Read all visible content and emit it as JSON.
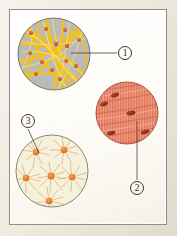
{
  "figure": {
    "background_color": "#f2ede2",
    "frame_color": "#8f8f8a",
    "frame_fill": "#fdfcf8",
    "caption": "",
    "panels": [
      {
        "id": "panel-1",
        "label": "1",
        "tissue": "loose connective tissue",
        "center_x": 54,
        "center_y": 54,
        "radius": 36,
        "background_color": "#b3b3b3",
        "fiber_color": "#f5c518",
        "fiber_highlight": "#ffe469",
        "nucleus_color": "#d4572a",
        "outline_color": "#6e6e6e",
        "nuclei": [
          {
            "x": 31,
            "y": 33
          },
          {
            "x": 46,
            "y": 29
          },
          {
            "x": 65,
            "y": 30
          },
          {
            "x": 56,
            "y": 44
          },
          {
            "x": 67,
            "y": 46
          },
          {
            "x": 79,
            "y": 40
          },
          {
            "x": 30,
            "y": 53
          },
          {
            "x": 42,
            "y": 62
          },
          {
            "x": 52,
            "y": 70
          },
          {
            "x": 66,
            "y": 61
          },
          {
            "x": 76,
            "y": 66
          },
          {
            "x": 36,
            "y": 74
          },
          {
            "x": 60,
            "y": 79
          }
        ]
      },
      {
        "id": "panel-2",
        "label": "2",
        "tissue": "smooth muscle tissue",
        "center_x": 127,
        "center_y": 113,
        "radius": 31,
        "background_color": "#f09a80",
        "stripe_color": "#d9694f",
        "nucleus_color": "#8e2f1c",
        "outline_color": "#a1503b",
        "nuclei": [
          {
            "x": 115,
            "y": 95,
            "angle": -22
          },
          {
            "x": 104,
            "y": 104,
            "angle": -18
          },
          {
            "x": 131,
            "y": 113,
            "angle": -10
          },
          {
            "x": 111,
            "y": 133,
            "angle": -12
          },
          {
            "x": 145,
            "y": 132,
            "angle": -16
          }
        ]
      },
      {
        "id": "panel-3",
        "label": "3",
        "tissue": "reticular / stellate cell tissue",
        "center_x": 52,
        "center_y": 171,
        "radius": 36,
        "background_color": "#f4f1d9",
        "fiber_color": "#e0a06a",
        "nucleus_color": "#e8742c",
        "outline_color": "#7a7a6a",
        "nuclei": [
          {
            "x": 36,
            "y": 152
          },
          {
            "x": 64,
            "y": 150
          },
          {
            "x": 26,
            "y": 178
          },
          {
            "x": 51,
            "y": 176
          },
          {
            "x": 72,
            "y": 177
          },
          {
            "x": 49,
            "y": 201
          }
        ]
      }
    ],
    "callouts": [
      {
        "id": "callout-1",
        "label": "1",
        "number_x": 118,
        "number_y": 46,
        "line_from_x": 71,
        "line_from_y": 53,
        "line_to_x": 117,
        "line_to_y": 53
      },
      {
        "id": "callout-2",
        "label": "2",
        "number_x": 130,
        "number_y": 181,
        "line_from_x": 137,
        "line_from_y": 121,
        "line_to_x": 137,
        "line_to_y": 180
      },
      {
        "id": "callout-3",
        "label": "3",
        "number_x": 21,
        "number_y": 114,
        "line_from_x": 28,
        "line_from_y": 128,
        "line_to_x": 39,
        "line_to_y": 153
      }
    ]
  }
}
